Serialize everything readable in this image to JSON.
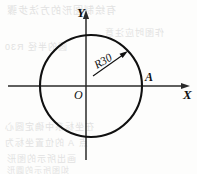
{
  "figure": {
    "background_color": "#fdfdfc",
    "line_color": "#101010",
    "axes": {
      "x_axis_label": "X",
      "y_axis_label": "Y",
      "origin_label": "O",
      "x_axis": {
        "x1": 8,
        "y1": 86,
        "x2": 190,
        "y2": 86,
        "arrow": "right"
      },
      "y_axis": {
        "x1": 86,
        "y1": 160,
        "x2": 86,
        "y2": 10,
        "arrow": "up"
      },
      "x_label_pos": {
        "x": 183,
        "y": 99
      },
      "y_label_pos": {
        "x": 77,
        "y": 17
      },
      "origin_label_pos": {
        "x": 74,
        "y": 99
      }
    },
    "circle": {
      "center": {
        "x": 91,
        "y": 86
      },
      "radius": 51,
      "stroke_width": 2.1
    },
    "dimension": {
      "label": "R30",
      "value": 30,
      "prefix": "R",
      "label_pos": {
        "x": 97,
        "y": 69
      },
      "label_rotation_deg": -31,
      "leader": {
        "x1": 93,
        "y1": 76,
        "x2": 127,
        "y2": 52
      },
      "arrow_tip": {
        "x": 128,
        "y": 51
      }
    },
    "points": [
      {
        "name": "A",
        "label": "A",
        "marker_pos": {
          "x": 142,
          "y": 86
        },
        "label_pos": {
          "x": 145,
          "y": 81
        }
      }
    ],
    "bleed_through_lines": [
      {
        "text": "有绘制图形的方法步骤",
        "x": 6,
        "y": 2,
        "size": 10
      },
      {
        "text": "作图时应注意",
        "x": 104,
        "y": 26,
        "size": 9
      },
      {
        "text": "圆的半径 R30",
        "x": 4,
        "y": 40,
        "size": 9
      },
      {
        "text": "在坐标系中确定圆心",
        "x": 4,
        "y": 120,
        "size": 9
      },
      {
        "text": "点 A 的位置坐标为",
        "x": 4,
        "y": 136,
        "size": 9
      },
      {
        "text": "画出所示的图形",
        "x": 6,
        "y": 152,
        "size": 9
      },
      {
        "text": "如图所示的圆形",
        "x": 6,
        "y": 164,
        "size": 8
      }
    ]
  }
}
